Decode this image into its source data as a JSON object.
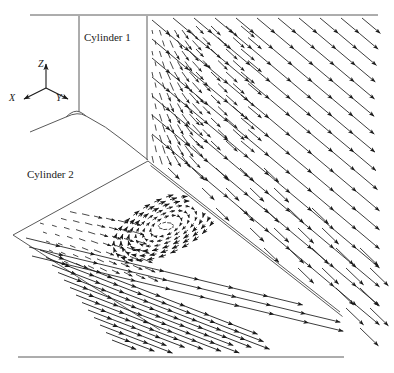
{
  "figure": {
    "type": "3d-flow-vector-field",
    "background_color": "#ffffff",
    "line_color": "#1a1a1a",
    "geometry_color": "#555555",
    "width": 394,
    "height": 373
  },
  "labels": {
    "cylinder1": "Cylinder 1",
    "cylinder2": "Cylinder 2"
  },
  "axes_triad": {
    "name": "coordinate-axes-triad",
    "origin": [
      46,
      88
    ],
    "axes": [
      {
        "label": "Z",
        "tip": [
          46,
          62
        ],
        "label_pos": [
          38,
          58
        ]
      },
      {
        "label": "X",
        "tip": [
          22,
          100
        ],
        "label_pos": [
          9,
          92
        ]
      },
      {
        "label": "Y",
        "tip": [
          70,
          100
        ],
        "label_pos": [
          56,
          92
        ]
      }
    ]
  },
  "chart_data": {
    "type": "scatter",
    "title": "",
    "xlabel": "",
    "ylabel": "",
    "geometry_lines": [
      {
        "name": "top-horizontal-edge",
        "points": [
          [
            30,
            15
          ],
          [
            378,
            15
          ]
        ]
      },
      {
        "name": "cylinder1-left-wall",
        "points": [
          [
            79,
            16
          ],
          [
            79,
            112
          ]
        ]
      },
      {
        "name": "cylinder1-right-wall",
        "points": [
          [
            147,
            16
          ],
          [
            147,
            160
          ]
        ]
      },
      {
        "name": "cylinder1-base-fillet",
        "points": [
          [
            30,
            132
          ],
          [
            66,
            117
          ],
          [
            86,
            116
          ],
          [
            104,
            124
          ],
          [
            124,
            140
          ],
          [
            140,
            152
          ],
          [
            148,
            160
          ]
        ]
      },
      {
        "name": "cylinder1-base-lip",
        "points": [
          [
            66,
            117
          ],
          [
            78,
            112
          ],
          [
            86,
            116
          ]
        ]
      },
      {
        "name": "ground-plane-left-edge",
        "points": [
          [
            13,
            235
          ],
          [
            148,
            161
          ]
        ]
      },
      {
        "name": "ground-plane-lower-left-edge",
        "points": [
          [
            13,
            235
          ],
          [
            160,
            330
          ]
        ]
      },
      {
        "name": "cylinder2-ridge-upper",
        "points": [
          [
            148,
            161
          ],
          [
            340,
            312
          ]
        ]
      },
      {
        "name": "cylinder2-ridge-lower",
        "points": [
          [
            150,
            165
          ],
          [
            342,
            316
          ]
        ]
      },
      {
        "name": "bottom-horizontal-edge",
        "points": [
          [
            18,
            357
          ],
          [
            344,
            357
          ]
        ]
      }
    ],
    "vector_regions": [
      {
        "name": "symmetry-plane-far-field",
        "note": "long chained arrows directed down-right, high velocity",
        "direction_deg": 40,
        "arrow_length_px": 30
      },
      {
        "name": "near-wall-boundary-layer",
        "note": "short near-vertical strokes, low velocity",
        "direction_deg": 75,
        "arrow_length_px": 7
      },
      {
        "name": "ground-plane-streamwise",
        "note": "long arrows running along the plane toward lower-right",
        "direction_deg": 18,
        "arrow_length_px": 26
      },
      {
        "name": "recirculation-vortex",
        "note": "closed elliptical circulation upstream of cylinder 2",
        "center": [
          166,
          226
        ],
        "rx": 48,
        "ry": 22,
        "rotation_deg": -26
      }
    ]
  }
}
